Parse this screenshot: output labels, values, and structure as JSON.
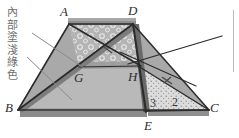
{
  "figure": {
    "type": "geometry-diagram",
    "annotation": {
      "name": "interior-fill-note",
      "text": "內部塗淺綠色",
      "characters": [
        "內",
        "部",
        "塗",
        "淺",
        "綠",
        "色"
      ],
      "color": "#6f6f6f",
      "orientation": "vertical"
    },
    "point_labels": [
      {
        "name": "point-a",
        "text": "A",
        "x": 60,
        "y": 11
      },
      {
        "name": "point-d",
        "text": "D",
        "x": 127,
        "y": 10
      },
      {
        "name": "point-g",
        "text": "G",
        "x": 75,
        "y": 72
      },
      {
        "name": "point-h",
        "text": "H",
        "x": 128,
        "y": 72
      },
      {
        "name": "point-b",
        "text": "B",
        "x": 6,
        "y": 99
      },
      {
        "name": "point-e",
        "text": "E",
        "x": 146,
        "y": 119
      },
      {
        "name": "point-c",
        "text": "C",
        "x": 211,
        "y": 99
      }
    ],
    "numeric_labels": [
      {
        "name": "segment-ratio-3",
        "text": "3",
        "x": 152,
        "y": 98
      },
      {
        "name": "segment-ratio-2",
        "text": "2",
        "x": 174,
        "y": 97
      }
    ],
    "vertices": {
      "A": {
        "x": 69,
        "y": 24
      },
      "D": {
        "x": 133,
        "y": 24
      },
      "B": {
        "x": 18,
        "y": 110
      },
      "C": {
        "x": 209,
        "y": 110
      },
      "E": {
        "x": 145,
        "y": 113
      },
      "G": {
        "x": 79,
        "y": 67
      },
      "H": {
        "x": 138,
        "y": 66
      }
    },
    "colors": {
      "outline": "#2b2b2b",
      "body_fill": "#a9a9a9",
      "light_fill": "#bdbdbd",
      "band_fill": "#9a9a9a",
      "edge_dark": "#5b5b5b",
      "edge_mid": "#767676",
      "bubble_fill": "#b5b5b5",
      "stipple_fill": "#d8d8d8",
      "label_gray": "#6f6f6f"
    }
  }
}
